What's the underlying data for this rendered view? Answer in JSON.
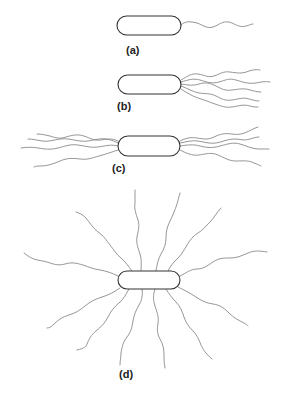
{
  "panels": [
    {
      "id": "a",
      "label": "(a)",
      "cell": {
        "x": 117,
        "y": 16,
        "w": 64,
        "h": 19
      },
      "label_pos": {
        "x": 126,
        "y": 52
      }
    },
    {
      "id": "b",
      "label": "(b)",
      "cell": {
        "x": 118,
        "y": 75,
        "w": 63,
        "h": 19
      },
      "label_pos": {
        "x": 117,
        "y": 108
      }
    },
    {
      "id": "c",
      "label": "(c)",
      "cell": {
        "x": 118,
        "y": 136,
        "w": 62,
        "h": 20
      },
      "label_pos": {
        "x": 112,
        "y": 170
      }
    },
    {
      "id": "d",
      "label": "(d)",
      "cell": {
        "x": 118,
        "y": 271,
        "w": 62,
        "h": 18
      },
      "label_pos": {
        "x": 119,
        "y": 376
      }
    }
  ],
  "colors": {
    "cell_stroke": "#333333",
    "flagella": "#8a8a8a",
    "label": "#222222"
  }
}
